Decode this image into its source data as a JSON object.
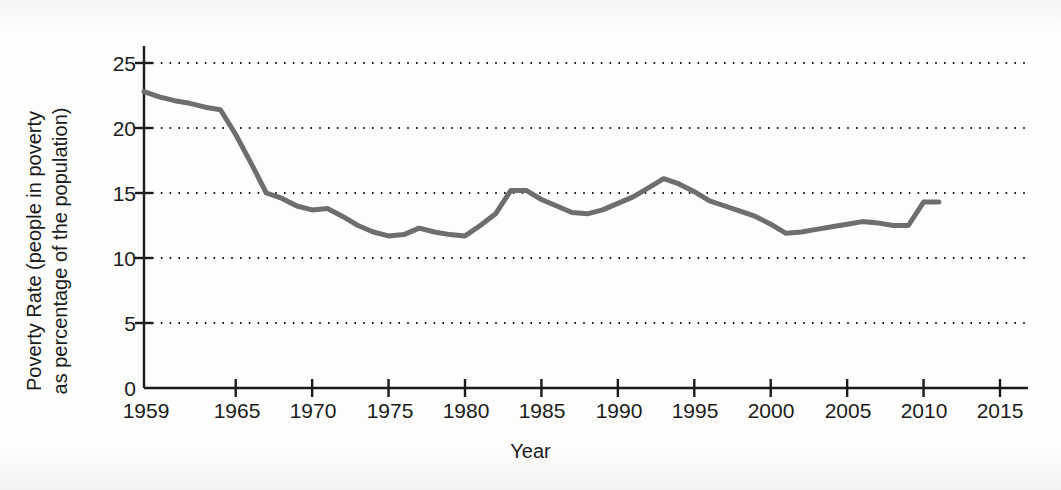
{
  "chart_data": {
    "type": "line",
    "title": "",
    "xlabel": "Year",
    "ylabel": "Poverty Rate (people in poverty as percentage of the population)",
    "ylabel_line1": "Poverty Rate (people in poverty",
    "ylabel_line2": "as percentage of the population)",
    "xlim": [
      1959,
      2015
    ],
    "ylim": [
      0,
      25
    ],
    "x_ticks": [
      1959,
      1965,
      1970,
      1975,
      1980,
      1985,
      1990,
      1995,
      2000,
      2005,
      2010,
      2015
    ],
    "x_tick_labels": [
      "1959",
      "1965",
      "1970",
      "1975",
      "1980",
      "1985",
      "1990",
      "1995",
      "2000",
      "2005",
      "2010",
      "2015"
    ],
    "y_ticks": [
      0,
      5,
      10,
      15,
      20,
      25
    ],
    "y_tick_labels": [
      "0",
      "5",
      "10",
      "15",
      "20",
      "25"
    ],
    "grid": "horizontal-dotted",
    "legend": "none",
    "line_color": "#6e6e6e",
    "axis_color": "#1b1b1b",
    "series": [
      {
        "name": "Poverty rate",
        "x": [
          1959,
          1960,
          1961,
          1962,
          1963,
          1964,
          1965,
          1966,
          1967,
          1968,
          1969,
          1970,
          1971,
          1972,
          1973,
          1974,
          1975,
          1976,
          1977,
          1978,
          1979,
          1980,
          1981,
          1982,
          1983,
          1984,
          1985,
          1986,
          1987,
          1988,
          1989,
          1990,
          1991,
          1992,
          1993,
          1994,
          1995,
          1996,
          1997,
          1998,
          1999,
          2000,
          2001,
          2002,
          2003,
          2004,
          2005,
          2006,
          2007,
          2008,
          2009,
          2010,
          2011
        ],
        "values": [
          22.8,
          22.4,
          22.1,
          21.9,
          21.6,
          21.4,
          19.5,
          17.3,
          15.0,
          14.6,
          14.0,
          13.7,
          13.8,
          13.2,
          12.5,
          12.0,
          11.7,
          11.8,
          12.3,
          12.0,
          11.8,
          11.7,
          12.5,
          13.4,
          15.2,
          15.2,
          14.5,
          14.0,
          13.5,
          13.4,
          13.7,
          14.2,
          14.7,
          15.4,
          16.1,
          15.7,
          15.1,
          14.4,
          14.0,
          13.6,
          13.2,
          12.6,
          11.9,
          12.0,
          12.2,
          12.4,
          12.6,
          12.8,
          12.7,
          12.5,
          12.5,
          14.3,
          14.3
        ]
      }
    ]
  },
  "axes": {
    "y_axis_name": "poverty-rate-axis",
    "x_axis_name": "year-axis"
  }
}
